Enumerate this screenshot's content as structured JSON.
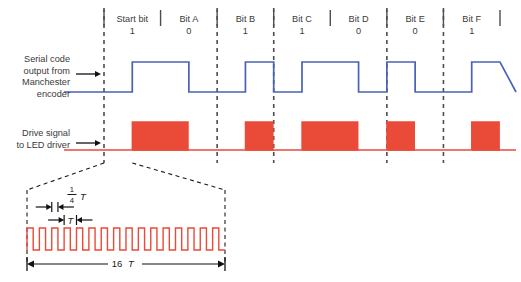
{
  "figure": {
    "colors": {
      "serial_trace": "#4a62b3",
      "drive_trace": "#ea4a38",
      "grid_dash": "#4d4d4d",
      "label_text": "#3a3a3a",
      "measure_text": "#1a1a1a"
    }
  },
  "bits": [
    {
      "name": "Start bit",
      "value": "1"
    },
    {
      "name": "Bit A",
      "value": "0"
    },
    {
      "name": "Bit B",
      "value": "1"
    },
    {
      "name": "Bit C",
      "value": "1"
    },
    {
      "name": "Bit D",
      "value": "0"
    },
    {
      "name": "Bit E",
      "value": "0"
    },
    {
      "name": "Bit F",
      "value": "1"
    }
  ],
  "signals": {
    "serial": {
      "label_lines": [
        "Serial code",
        "output from",
        "Manchester",
        "encoder"
      ],
      "name": "serial-code-output"
    },
    "drive": {
      "label_lines": [
        "Drive signal",
        "to LED driver"
      ],
      "name": "drive-signal-led-driver"
    }
  },
  "detail": {
    "quarter_t_numerator": "1",
    "quarter_t_denominator": "4",
    "quarter_t_symbol": "T",
    "period_symbol": "T",
    "span_count": "16",
    "span_symbol": "T",
    "pulse_count": 16
  },
  "chart_data": {
    "type": "line",
    "xlabel": "",
    "ylabel": "",
    "categories": [
      "Start bit",
      "Bit A",
      "Bit B",
      "Bit C",
      "Bit D",
      "Bit E",
      "Bit F"
    ],
    "values": [
      1,
      0,
      1,
      1,
      0,
      0,
      1
    ],
    "series": [
      {
        "name": "Serial code output from Manchester encoder",
        "color": "#4a62b3",
        "encoding": "manchester",
        "levels": [
          {
            "bit": "Start bit",
            "first_half": 0,
            "second_half": 1
          },
          {
            "bit": "Bit A",
            "first_half": 1,
            "second_half": 0
          },
          {
            "bit": "Bit B",
            "first_half": 0,
            "second_half": 1
          },
          {
            "bit": "Bit C",
            "first_half": 0,
            "second_half": 1
          },
          {
            "bit": "Bit D",
            "first_half": 1,
            "second_half": 0
          },
          {
            "bit": "Bit E",
            "first_half": 1,
            "second_half": 0
          },
          {
            "bit": "Bit F",
            "first_half": 0,
            "second_half": 1
          }
        ]
      },
      {
        "name": "Drive signal to LED driver",
        "color": "#ea4a38",
        "encoding": "burst-modulated",
        "burst_pulses_per_half_bit": 16,
        "pulse_period": "T",
        "pulse_high_width": "1/4 T",
        "half_bit_duration": "16 T"
      }
    ],
    "grid": true,
    "legend": "none"
  }
}
